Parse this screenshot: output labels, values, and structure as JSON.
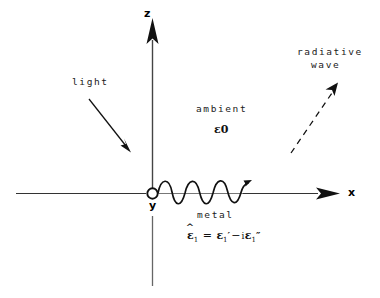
{
  "figure": {
    "background_color": "#ffffff",
    "ink_color": "#111111"
  },
  "axes": {
    "z_label": "z",
    "x_label": "x",
    "y_label": "y",
    "origin_marker": "open-circle"
  },
  "annotations": {
    "light": "light",
    "ambient": "ambient",
    "ambient_permittivity": "ε0",
    "metal": "metal",
    "radiative_line1": "radiative",
    "radiative_line2": "wave"
  },
  "equation": {
    "lhs_symbol": "ε",
    "lhs_hat": true,
    "lhs_sub": "1",
    "equals": "=",
    "term1_symbol": "ε",
    "term1_sub": "1",
    "term1_prime": "′",
    "operator": "−",
    "imaginary_unit": "i",
    "term2_symbol": "ε",
    "term2_sub": "1",
    "term2_prime": "″",
    "plain_text": "ε̂1 = ε1′ − iε1″"
  },
  "wave": {
    "name": "surface-plasmon-wave",
    "cycles": 3,
    "direction": "+x",
    "style": "solid-sinusoid-with-arrow"
  },
  "radiative_arrow": {
    "style": "dashed",
    "direction": "up-right"
  },
  "light_arrow": {
    "style": "solid",
    "direction": "down-right"
  }
}
